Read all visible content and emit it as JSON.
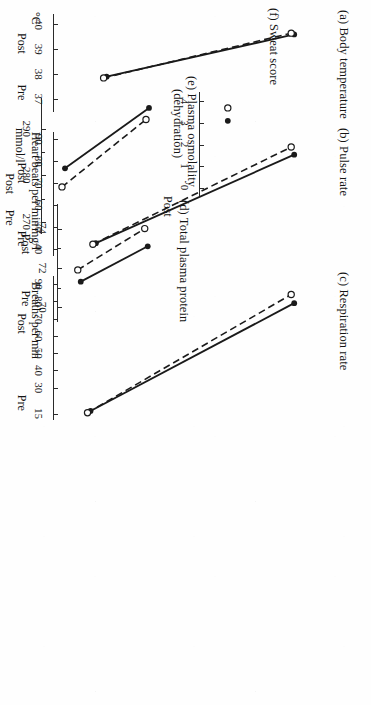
{
  "figure": {
    "orientation": "rotated-90-clockwise",
    "background_color": "#ffffff",
    "ink_color": "#1a1a1a",
    "category_labels": [
      "Pre",
      "Post"
    ]
  },
  "chart_data": [
    {
      "id": "a",
      "type": "line",
      "title": "(a) Body temperature",
      "panel_letter": "(a)",
      "panel_name": "Body temperature",
      "ylabel": "°C",
      "xlabel": "",
      "x": [
        "Pre",
        "Post"
      ],
      "categories": [
        "Pre",
        "Post"
      ],
      "ticks": [
        40,
        39,
        38,
        37
      ],
      "minor_ticks": [],
      "ylim": [
        36.6,
        40.3
      ],
      "series": [
        {
          "name": "solid",
          "marker": "filled-circle",
          "line": "solid",
          "values": [
            37.9,
            39.6
          ]
        },
        {
          "name": "dashed",
          "marker": "open-circle",
          "line": "dashed",
          "values": [
            37.85,
            39.65
          ]
        }
      ]
    },
    {
      "id": "b",
      "type": "line",
      "title": "(b) Pulse rate",
      "panel_letter": "(b)",
      "panel_name": "Pulse rate",
      "ylabel": "Heart beats per min",
      "xlabel": "",
      "x": [
        "Pre",
        "Post"
      ],
      "categories": [
        "Pre",
        "Post"
      ],
      "ticks": [
        90,
        80,
        70,
        60,
        50,
        40
      ],
      "minor_ticks": [],
      "ylim": [
        38,
        92
      ],
      "series": [
        {
          "name": "solid",
          "marker": "filled-circle",
          "line": "solid",
          "values": [
            42.5,
            83
          ]
        },
        {
          "name": "dashed",
          "marker": "open-circle",
          "line": "dashed",
          "values": [
            42,
            86.5
          ]
        }
      ]
    },
    {
      "id": "c",
      "type": "line",
      "title": "(c) Respiration rate",
      "panel_letter": "(c)",
      "panel_name": "Respiration rate",
      "ylabel": "Breaths per min",
      "xlabel": "",
      "x": [
        "Pre",
        "Post"
      ],
      "categories": [
        "Pre",
        "Post"
      ],
      "ticks": [
        90,
        80,
        70,
        60,
        50,
        40,
        30,
        15
      ],
      "minor_ticks": [],
      "ylim": [
        13,
        93
      ],
      "series": [
        {
          "name": "solid",
          "marker": "filled-circle",
          "line": "solid",
          "values": [
            16.5,
            79
          ]
        },
        {
          "name": "dashed",
          "marker": "open-circle",
          "line": "dashed",
          "values": [
            15.5,
            84
          ]
        }
      ]
    },
    {
      "id": "d",
      "type": "line",
      "title": "(d) Total plasma protein",
      "panel_letter": "(d)",
      "panel_name": "Total plasma protein",
      "ylabel": "mg/l",
      "xlabel": "",
      "x": [
        "Pre",
        "Post"
      ],
      "categories": [
        "Pre",
        "Post"
      ],
      "ticks": [
        74,
        72,
        70
      ],
      "minor_ticks": [
        73,
        71
      ],
      "ylim": [
        69.4,
        75.1
      ],
      "series": [
        {
          "name": "solid",
          "marker": "filled-circle",
          "line": "solid",
          "values": [
            71.3,
            73.1
          ]
        },
        {
          "name": "dashed",
          "marker": "open-circle",
          "line": "dashed",
          "values": [
            71.9,
            74.0
          ]
        }
      ]
    },
    {
      "id": "e",
      "type": "line",
      "title": "(e) Plasma osmolality (dehydration)",
      "panel_letter": "(e)",
      "panel_name": "Plasma osmolality",
      "panel_name_line2": "(dehydration)",
      "ylabel": "mmol/l",
      "xlabel": "",
      "x": [
        "Pre",
        "Post"
      ],
      "categories": [
        "Pre",
        "Post"
      ],
      "ticks": [
        290,
        280,
        270
      ],
      "minor_ticks": [
        285,
        275
      ],
      "ylim": [
        268,
        296
      ],
      "series": [
        {
          "name": "solid",
          "marker": "filled-circle",
          "line": "solid",
          "values": [
            281.5,
            294.5
          ]
        },
        {
          "name": "dashed",
          "marker": "open-circle",
          "line": "dashed",
          "values": [
            277.5,
            292.0
          ]
        }
      ]
    },
    {
      "id": "f",
      "type": "scatter",
      "title": "(f) Sweat score",
      "panel_letter": "(f)",
      "panel_name": "Sweat score",
      "ylabel": "",
      "xlabel": "",
      "x": [
        "Post"
      ],
      "categories": [
        "Post"
      ],
      "ticks": [
        4,
        3,
        2,
        1,
        0
      ],
      "minor_ticks": [],
      "ylim": [
        -0.25,
        4.3
      ],
      "series": [
        {
          "name": "solid",
          "marker": "filled-circle",
          "line": "none",
          "values": [
            3.1
          ]
        },
        {
          "name": "dashed",
          "marker": "open-circle",
          "line": "none",
          "values": [
            3.7
          ]
        }
      ]
    }
  ]
}
